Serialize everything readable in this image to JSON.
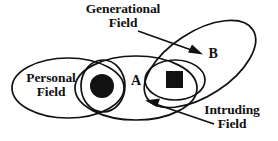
{
  "diagram": {
    "background_color": "#ffffff",
    "stroke_color": "#111111",
    "fill_color": "#111111",
    "labels": {
      "generational_field": "Generational\nField",
      "personal_field": "Personal\nField",
      "intruding_field": "Intruding\nField",
      "region_a": "A",
      "region_b": "B"
    },
    "shapes": [
      {
        "name": "personal-field-ellipse",
        "type": "ellipse",
        "cx": 68,
        "cy": 88,
        "rx": 56,
        "ry": 30,
        "rotation": 0
      },
      {
        "name": "inner-personal-ellipse",
        "type": "ellipse",
        "cx": 103,
        "cy": 86,
        "rx": 22,
        "ry": 26,
        "rotation": 0
      },
      {
        "name": "region-a-ellipse",
        "type": "ellipse",
        "cx": 136,
        "cy": 88,
        "rx": 61,
        "ry": 32,
        "rotation": 0
      },
      {
        "name": "intruding-field-ellipse",
        "type": "ellipse",
        "cx": 175,
        "cy": 80,
        "rx": 30,
        "ry": 20,
        "rotation": 0
      },
      {
        "name": "generational-field-ellipse",
        "type": "ellipse",
        "cx": 200,
        "cy": 64,
        "rx": 63,
        "ry": 32,
        "rotation": -33
      }
    ],
    "markers": [
      {
        "name": "personal-field-dot",
        "type": "filled-circle",
        "cx": 102,
        "cy": 86,
        "r": 12
      },
      {
        "name": "intruding-field-square",
        "type": "filled-square",
        "x": 166,
        "y": 71,
        "size": 17
      }
    ],
    "arrows": [
      {
        "name": "generational-field-arrow",
        "from_x": 138,
        "from_y": 31,
        "to_x": 201,
        "to_y": 54
      },
      {
        "name": "intruding-field-arrow",
        "from_x": 214,
        "from_y": 124,
        "to_x": 146,
        "to_y": 101
      }
    ]
  }
}
